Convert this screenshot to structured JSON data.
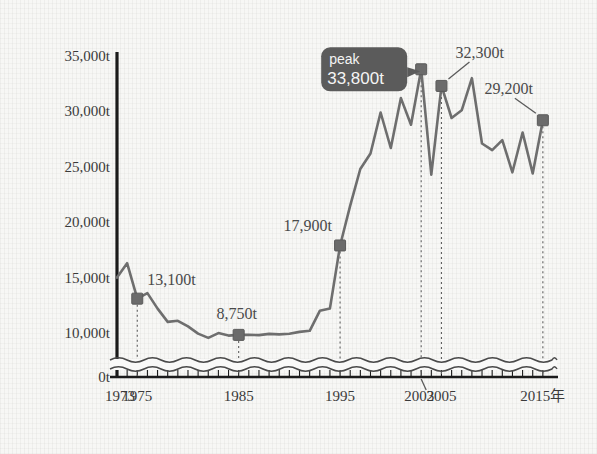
{
  "chart_data": {
    "type": "line",
    "title": "",
    "subtitle": "",
    "xlabel": "年",
    "ylabel": "",
    "unit": "t",
    "grid": false,
    "legend": "none",
    "axis_break": true,
    "xlim": [
      1973,
      2016
    ],
    "ylim": [
      0,
      35000
    ],
    "y_ticks": [
      {
        "value": 0,
        "label": "0t"
      },
      {
        "value": 10000,
        "label": "10,000t"
      },
      {
        "value": 15000,
        "label": "15,000t"
      },
      {
        "value": 20000,
        "label": "20,000t"
      },
      {
        "value": 25000,
        "label": "25,000t"
      },
      {
        "value": 30000,
        "label": "30,000t"
      },
      {
        "value": 35000,
        "label": "35,000t"
      }
    ],
    "x_ticks": [
      {
        "value": 1973,
        "label": "1973"
      },
      {
        "value": 1975,
        "label": "1975"
      },
      {
        "value": 1985,
        "label": "1985"
      },
      {
        "value": 1995,
        "label": "1995"
      },
      {
        "value": 2003,
        "label": "2003"
      },
      {
        "value": 2005,
        "label": "2005"
      },
      {
        "value": 2015,
        "label": "2015年"
      }
    ],
    "x": [
      1973,
      1974,
      1975,
      1976,
      1977,
      1978,
      1979,
      1980,
      1981,
      1982,
      1983,
      1984,
      1985,
      1986,
      1987,
      1988,
      1989,
      1990,
      1991,
      1992,
      1993,
      1994,
      1995,
      1996,
      1997,
      1998,
      1999,
      2000,
      2001,
      2002,
      2003,
      2004,
      2005,
      2006,
      2007,
      2008,
      2009,
      2010,
      2011,
      2012,
      2013,
      2014,
      2015
    ],
    "values": [
      15000,
      16300,
      13100,
      13600,
      12200,
      11000,
      11100,
      10600,
      9600,
      6700,
      9900,
      8300,
      8750,
      8800,
      8600,
      9400,
      9100,
      9500,
      10100,
      10200,
      12000,
      12200,
      17900,
      21500,
      24800,
      26200,
      29900,
      26700,
      31200,
      28800,
      33800,
      24300,
      32300,
      29400,
      30100,
      33000,
      27100,
      26500,
      27400,
      24500,
      28100,
      24400,
      29200
    ],
    "markers": [
      {
        "year": 1975,
        "value": 13100,
        "label": "13,100t"
      },
      {
        "year": 1985,
        "value": 8750,
        "label": "8,750t"
      },
      {
        "year": 1995,
        "value": 17900,
        "label": "17,900t"
      },
      {
        "year": 2003,
        "value": 33800,
        "label": "33,800t"
      },
      {
        "year": 2005,
        "value": 32300,
        "label": "32,300t"
      },
      {
        "year": 2015,
        "value": 29200,
        "label": "29,200t"
      }
    ],
    "annotations": [
      {
        "name": "peak-callout",
        "title": "peak",
        "value_label": "33,800t",
        "year": 2003,
        "value": 33800
      }
    ],
    "colors": {
      "line": "#6e6e6e",
      "marker": "#6b6b6b",
      "axis": "#1b1b1b",
      "callout_bg": "#5b5b5b",
      "callout_text": "#f4f4f4",
      "background": "#f7f7f5"
    }
  }
}
